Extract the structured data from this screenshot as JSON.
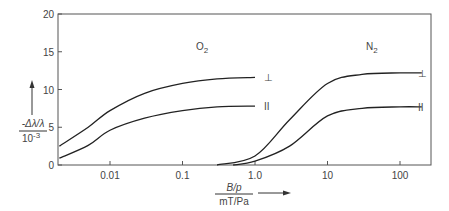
{
  "chart_data": {
    "type": "line",
    "title": "",
    "xlabel": "B/p  mT/Pa",
    "xlabel_num": "B/p",
    "xlabel_den": "mT/Pa",
    "ylabel_num": "-Δλ/λ",
    "ylabel_den": "10^-3",
    "xscale": "log",
    "xlim": [
      0.002,
      300
    ],
    "ylim": [
      0,
      20
    ],
    "xticks": [
      "0.01",
      "0.1",
      "1.0",
      "10",
      "100"
    ],
    "yticks": [
      "0",
      "5",
      "10",
      "15",
      "20"
    ],
    "grid": false,
    "annotations": [
      {
        "text": "O2",
        "at": [
          0.05,
          13
        ]
      },
      {
        "text": "N2",
        "at": [
          30,
          13
        ]
      },
      {
        "text": "⊥",
        "series": "O2 perpendicular"
      },
      {
        "text": "∥",
        "series": "O2 parallel"
      },
      {
        "text": "⊥",
        "series": "N2 perpendicular"
      },
      {
        "text": "∥",
        "series": "N2 parallel"
      }
    ],
    "series": [
      {
        "name": "O2 ⊥",
        "x": [
          0.002,
          0.005,
          0.01,
          0.03,
          0.1,
          0.3,
          1.0
        ],
        "y": [
          2.5,
          5.0,
          7.2,
          9.5,
          10.8,
          11.4,
          11.6
        ]
      },
      {
        "name": "O2 ∥",
        "x": [
          0.002,
          0.005,
          0.01,
          0.03,
          0.1,
          0.3,
          1.0
        ],
        "y": [
          0.9,
          2.6,
          4.6,
          6.2,
          7.2,
          7.7,
          7.8
        ]
      },
      {
        "name": "N2 ⊥",
        "x": [
          0.3,
          1.0,
          3.0,
          10,
          30,
          100,
          200
        ],
        "y": [
          0.0,
          1.2,
          6.0,
          10.8,
          12.0,
          12.2,
          12.2
        ]
      },
      {
        "name": "N2 ∥",
        "x": [
          0.5,
          1.0,
          3.0,
          10,
          30,
          100,
          200
        ],
        "y": [
          0.0,
          0.5,
          2.5,
          6.5,
          7.5,
          7.7,
          7.7
        ]
      }
    ]
  },
  "labels": {
    "o2": "O",
    "o2_sub": "2",
    "n2": "N",
    "n2_sub": "2",
    "perp": "⊥",
    "par": "II"
  }
}
